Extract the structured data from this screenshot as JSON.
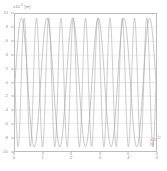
{
  "figure": {
    "background": "#ffffff",
    "frame_color": "#bdbdbd",
    "grid_color": "#d9d9d9",
    "tick_label_color": "#8f8f8f"
  },
  "labels": {
    "y_exponent_prefix": "x10",
    "y_exponent_power": "-9",
    "y_unit": "[m]",
    "x_exponent_prefix": "x10",
    "x_exponent_power": "-12",
    "x_unit": "[s]"
  },
  "chart_data": {
    "type": "line",
    "title": "",
    "xlabel": "x10⁻¹² [s]",
    "ylabel": "x10⁻⁹ [m]",
    "xlim": [
      0,
      5
    ],
    "ylim": [
      -10,
      10
    ],
    "grid": true,
    "legend": "none",
    "x_ticks": [
      "0",
      "1",
      "2",
      "3",
      "4",
      "5"
    ],
    "x_tick_values": [
      0,
      1,
      2,
      3,
      4,
      5
    ],
    "y_ticks": [
      "10",
      "8",
      "6",
      "4",
      "2",
      "0",
      "-2",
      "-4",
      "-6",
      "-8",
      "-10"
    ],
    "y_tick_values": [
      10,
      8,
      6,
      4,
      2,
      0,
      -2,
      -4,
      -6,
      -8,
      -10
    ],
    "series": [
      {
        "name": "oscillation-fast",
        "color": "#a8a8a8",
        "amplitude": 9.4,
        "cycles": 11.5,
        "phase_deg": 180,
        "linewidth": 0.6
      },
      {
        "name": "oscillation-slow",
        "color": "#9e9e9e",
        "amplitude": 9.4,
        "cycles": 5.5,
        "phase_deg": 0,
        "linewidth": 0.6
      }
    ]
  }
}
